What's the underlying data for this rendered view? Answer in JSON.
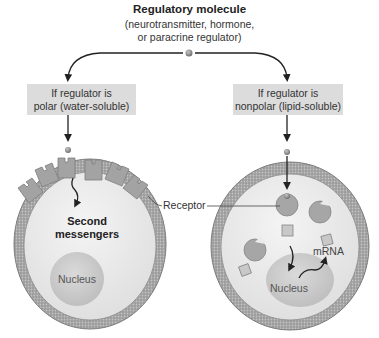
{
  "header": {
    "title": "Regulatory molecule",
    "subtitle_line1": "(neurotransmitter, hormone,",
    "subtitle_line2": "or paracrine regulator)"
  },
  "branches": [
    {
      "condition_line1": "If regulator is",
      "condition_line2": "polar (water-soluble)",
      "cell_labels": {
        "second_messengers_line1": "Second",
        "second_messengers_line2": "messengers",
        "nucleus": "Nucleus"
      }
    },
    {
      "condition_line1": "If regulator is",
      "condition_line2": "nonpolar (lipid-soluble)",
      "cell_labels": {
        "mrna": "mRNA",
        "nucleus": "Nucleus"
      }
    }
  ],
  "shared_labels": {
    "receptor": "Receptor"
  },
  "colors": {
    "box_fill": "#dcdcdc",
    "membrane": "#8c8c8c",
    "cytoplasm": "#ebebeb",
    "nucleus": "#cfcfcf",
    "receptor": "#9a9a9a",
    "molecule": "#8a8a8a"
  }
}
